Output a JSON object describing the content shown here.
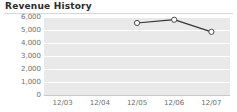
{
  "panel": {
    "title": "Revenue History",
    "background_color": "#ffffff",
    "title_color": "#2b2b2b",
    "rule_color": "#d8d8d8"
  },
  "chart_data": {
    "type": "line",
    "title": "Revenue History",
    "xlabel": "",
    "ylabel": "",
    "categories": [
      "12/03",
      "12/04",
      "12/05",
      "12/06",
      "12/07"
    ],
    "x": [
      "12/03",
      "12/04",
      "12/05",
      "12/06",
      "12/07"
    ],
    "values": [
      null,
      null,
      5540,
      5790,
      4860
    ],
    "series": [
      {
        "name": "Revenue",
        "values": [
          null,
          null,
          5540,
          5790,
          4860
        ],
        "line_color": "#333333",
        "marker": "open-circle",
        "marker_fill": "#ffffff",
        "marker_stroke": "#4a4a4a"
      }
    ],
    "ylim": [
      0,
      6000
    ],
    "ytick_values": [
      0,
      1000,
      2000,
      3000,
      4000,
      5000,
      6000
    ],
    "ytick_labels": [
      "0",
      "1,000",
      "2,000",
      "3,000",
      "4,000",
      "5,000",
      "6,000"
    ],
    "xtick_labels": [
      "12/03",
      "12/04",
      "12/05",
      "12/06",
      "12/07"
    ],
    "grid": true,
    "grid_style": "horizontal-banded",
    "band_color": "#e9e9e9",
    "gridline_color": "#ffffff",
    "legend": false,
    "legend_position": "none",
    "axis_label_color": "#6e6e6e"
  }
}
